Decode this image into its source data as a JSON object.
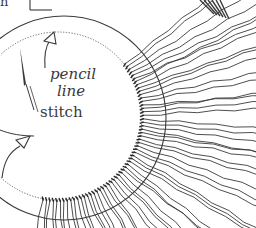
{
  "diagram": {
    "labels": {
      "top_fragment": "n",
      "pencil": "pencil",
      "line": "line",
      "stitch": "stitch"
    },
    "colors": {
      "ink": "#3a3a3a",
      "background": "#ffffff"
    },
    "elements": [
      "outer-circle",
      "dotted-pencil-circle",
      "needle",
      "pencil-line-arrow",
      "stitch-arrow",
      "radiating-hair-strands",
      "stitch-knots"
    ]
  }
}
